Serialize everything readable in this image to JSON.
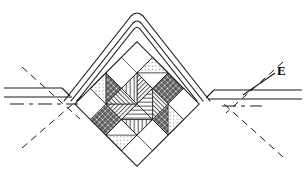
{
  "diagram": {
    "label_E": "E",
    "stroke_color": "#1a1a1a",
    "fill_hatch_color": "#333333",
    "background": "#ffffff",
    "center": {
      "x": 137,
      "y": 104
    },
    "half_diagonal": 62,
    "grid_divisions": 4,
    "apex": {
      "x": 137,
      "y": 14
    },
    "roads": {
      "left_y_top": 88,
      "left_y_bottom": 99,
      "right_y_top": 90,
      "right_y_bottom": 101,
      "centerline_y": 104
    },
    "tiles": [
      {
        "name": "top-vertex-square",
        "pattern": "grid-dense"
      },
      {
        "name": "left-vertex-square",
        "pattern": "grid-dense"
      },
      {
        "name": "right-vertex-square",
        "pattern": "grid-dense"
      },
      {
        "name": "bottom-vertex-square",
        "pattern": "grid-dense"
      },
      {
        "name": "upper-left-triangle",
        "pattern": "stipple"
      },
      {
        "name": "upper-right-triangle",
        "pattern": "stipple"
      },
      {
        "name": "lower-left-triangle",
        "pattern": "stipple"
      },
      {
        "name": "lower-right-triangle",
        "pattern": "stipple"
      },
      {
        "name": "center-north-triangle",
        "pattern": "vertical-lines"
      },
      {
        "name": "center-south-triangle",
        "pattern": "vertical-lines"
      },
      {
        "name": "center-west-triangle",
        "pattern": "horizontal-lines"
      },
      {
        "name": "center-east-triangle",
        "pattern": "horizontal-lines"
      },
      {
        "name": "inner-ne-triangle",
        "pattern": "diagonal-lines"
      },
      {
        "name": "inner-sw-triangle",
        "pattern": "diagonal-lines"
      },
      {
        "name": "blank-nw",
        "pattern": "none"
      },
      {
        "name": "blank-se",
        "pattern": "none"
      }
    ],
    "construction_lines": {
      "style": "dashed",
      "angle_deg": 45,
      "count": 4
    },
    "centerline_style": "dash-dot"
  }
}
